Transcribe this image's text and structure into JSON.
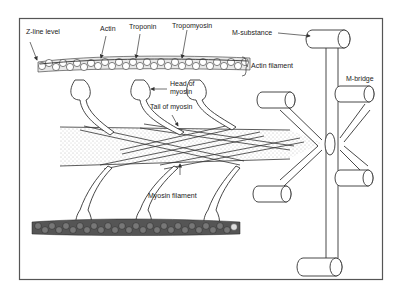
{
  "diagram": {
    "labels": {
      "z_line": "Z-line level",
      "actin": "Actin",
      "troponin": "Troponin",
      "tropomyosin": "Tropomyosin",
      "m_substance": "M-substance",
      "actin_filament": "Actin filament",
      "head_of_myosin_1": "Head of",
      "head_of_myosin_2": "myosin",
      "m_bridge": "M-bridge",
      "tail_of_myosin": "Tail of myosin",
      "myosin_filament": "Myosin filament"
    },
    "colors": {
      "line": "#333333",
      "border": "#555555",
      "stipple": "#8a8a8a",
      "bead_dark": "#444444",
      "background": "#ffffff"
    }
  }
}
